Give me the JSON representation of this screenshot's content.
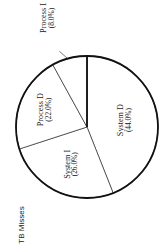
{
  "chart_data": {
    "type": "pie",
    "title": "TB Misses",
    "orientation": "rotated 90° counter-clockwise",
    "start_angle_deg": 0,
    "direction": "clockwise",
    "slices": [
      {
        "label": "System D",
        "value": 44.0,
        "value_label": "(44.0%)"
      },
      {
        "label": "System I",
        "value": 26.0,
        "value_label": "(26.0%)"
      },
      {
        "label": "Process D",
        "value": 22.0,
        "value_label": "(22.0%)"
      },
      {
        "label": "Process I",
        "value": 8.0,
        "value_label": "(8.0%)",
        "callout": true
      }
    ],
    "colors": {
      "fill": "#ffffff",
      "stroke": "#111111"
    },
    "legend": "none"
  }
}
